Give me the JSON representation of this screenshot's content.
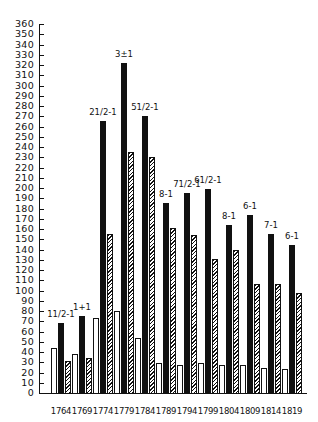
{
  "chart_data": {
    "type": "bar",
    "title": "",
    "xlabel": "",
    "ylabel": "",
    "ylim": [
      0,
      360
    ],
    "yticks": [
      0,
      10,
      20,
      30,
      40,
      50,
      60,
      70,
      80,
      90,
      100,
      110,
      120,
      130,
      140,
      150,
      160,
      170,
      180,
      190,
      200,
      210,
      220,
      230,
      240,
      250,
      260,
      270,
      280,
      290,
      300,
      310,
      320,
      330,
      340,
      350,
      360
    ],
    "ytick_labels": [
      "0",
      "10",
      "20",
      "30",
      "40",
      "50",
      "60",
      "70",
      "80",
      "90",
      "100",
      "110",
      "120",
      "130",
      "140",
      "150",
      "160",
      "170",
      "180",
      "190",
      "200",
      "210",
      "220",
      "230",
      "240",
      "250",
      "260",
      "270",
      "280",
      "290",
      "300",
      "310",
      "320",
      "330",
      "340",
      "350",
      "360"
    ],
    "grid": false,
    "legend": null,
    "categories": [
      "1764",
      "1769",
      "1774",
      "1779",
      "1784",
      "1789",
      "1794",
      "1799",
      "1804",
      "1809",
      "1814",
      "1819"
    ],
    "series": [
      {
        "name": "white (outline)",
        "style": "white",
        "values": [
          44,
          38,
          73,
          80,
          54,
          29,
          27,
          29,
          27,
          27,
          24,
          23
        ]
      },
      {
        "name": "black (solid)",
        "style": "black",
        "values": [
          68,
          75,
          265,
          322,
          270,
          185,
          195,
          199,
          164,
          174,
          155,
          144
        ]
      },
      {
        "name": "hatched",
        "style": "hatch",
        "values": [
          31,
          34,
          155,
          235,
          230,
          161,
          154,
          131,
          140,
          106,
          106,
          98
        ]
      }
    ],
    "annotations": [
      "1 1/2-1",
      "1+1",
      "2 1/2-1",
      "3±1",
      "5 1/2-1",
      "8-1",
      "7 1/2-1",
      "6 1/2-1",
      "8-1",
      "6-1",
      "7-1",
      "6-1"
    ]
  },
  "labels": {
    "annotations_display": [
      "11/2-1",
      "1+1",
      "21/2-1",
      "3±1",
      "51/2-1",
      "8-1",
      "71/2-1",
      "61/2-1",
      "8-1",
      "6-1",
      "7-1",
      "6-1"
    ]
  }
}
